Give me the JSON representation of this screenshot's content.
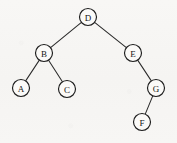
{
  "figure": {
    "type": "binary-tree-diagram",
    "background_color": "#f7f6f4",
    "stroke_color": "#1d1d1d",
    "edge_color": "#2b2b2b",
    "node_fill": "#fbfaf8",
    "cropped_header_text": "- - - - -"
  },
  "chart_data": {
    "type": "diagram",
    "title": "",
    "xlabel": "",
    "ylabel": "",
    "nodes": [
      {
        "id": "D",
        "label": "D",
        "x": 88,
        "y": 17,
        "r": 8.5,
        "level": 0
      },
      {
        "id": "B",
        "label": "B",
        "x": 44,
        "y": 53,
        "r": 8.5,
        "level": 1
      },
      {
        "id": "E",
        "label": "E",
        "x": 133,
        "y": 53,
        "r": 8.5,
        "level": 1
      },
      {
        "id": "A",
        "label": "A",
        "x": 21,
        "y": 88,
        "r": 8.5,
        "level": 2
      },
      {
        "id": "C",
        "label": "C",
        "x": 67,
        "y": 89,
        "r": 8.5,
        "level": 2
      },
      {
        "id": "G",
        "label": "G",
        "x": 156,
        "y": 88,
        "r": 8.5,
        "level": 2
      },
      {
        "id": "F",
        "label": "F",
        "x": 142,
        "y": 122,
        "r": 8.5,
        "level": 3
      }
    ],
    "edges": [
      {
        "from": "D",
        "to": "B",
        "side": "left"
      },
      {
        "from": "D",
        "to": "E",
        "side": "right"
      },
      {
        "from": "B",
        "to": "A",
        "side": "left"
      },
      {
        "from": "B",
        "to": "C",
        "side": "right"
      },
      {
        "from": "E",
        "to": "G",
        "side": "right"
      },
      {
        "from": "G",
        "to": "F",
        "side": "left"
      }
    ],
    "root": "D",
    "legend": [],
    "annotations": []
  }
}
